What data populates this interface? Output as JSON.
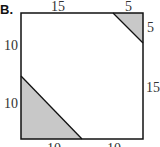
{
  "problem_label": "B.",
  "diagram": {
    "shape": "square",
    "labels": {
      "top_left_segment": "15",
      "top_right_segment": "5",
      "right_upper_segment": "5",
      "right_lower_segment": "15",
      "left_upper_segment": "10",
      "left_lower_segment": "10",
      "bottom_left_segment": "10",
      "bottom_right_segment": "10"
    },
    "shaded_regions": [
      {
        "name": "top-right-triangle",
        "legs": [
          "5",
          "5"
        ]
      },
      {
        "name": "bottom-left-triangle",
        "legs": [
          "10",
          "10"
        ]
      }
    ],
    "colors": {
      "fill": "#c8c8c8",
      "stroke": "#111111",
      "background": "#ffffff"
    }
  }
}
